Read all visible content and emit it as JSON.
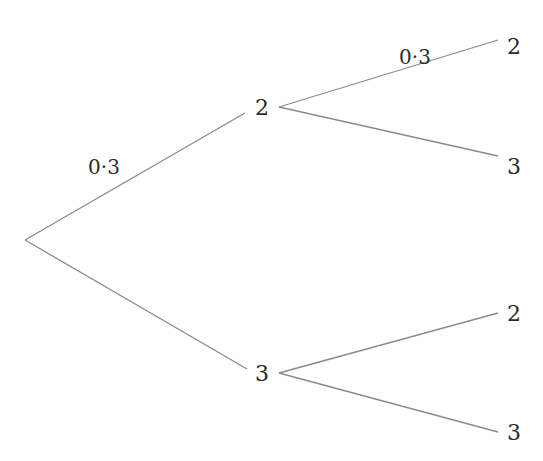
{
  "diagram": {
    "type": "probability-tree",
    "root": {
      "x": 25,
      "y": 240
    },
    "level1": [
      {
        "label": "2",
        "x": 262,
        "y": 107,
        "in_end": [
          245,
          113
        ],
        "out_start": [
          279,
          107
        ],
        "probability": "0·3"
      },
      {
        "label": "3",
        "x": 262,
        "y": 373,
        "in_end": [
          247,
          369
        ],
        "out_start": [
          279,
          373
        ],
        "probability": ""
      }
    ],
    "level2": [
      {
        "parent": 0,
        "label": "2",
        "x": 514,
        "y": 46,
        "in_end": [
          498,
          40
        ],
        "probability": "0·3"
      },
      {
        "parent": 0,
        "label": "3",
        "x": 514,
        "y": 166,
        "in_end": [
          498,
          156
        ],
        "probability": ""
      },
      {
        "parent": 1,
        "label": "2",
        "x": 514,
        "y": 313,
        "in_end": [
          498,
          313
        ],
        "probability": ""
      },
      {
        "parent": 1,
        "label": "3",
        "x": 514,
        "y": 432,
        "in_end": [
          498,
          432
        ],
        "probability": ""
      }
    ],
    "probability_labels": [
      {
        "text": "0·3",
        "x": 104,
        "y": 167,
        "branch": "root-to-2"
      },
      {
        "text": "0·3",
        "x": 415,
        "y": 57,
        "branch": "2-to-2"
      }
    ],
    "line_color": "#8a8a8a",
    "text_color": "#2a2a2a"
  }
}
